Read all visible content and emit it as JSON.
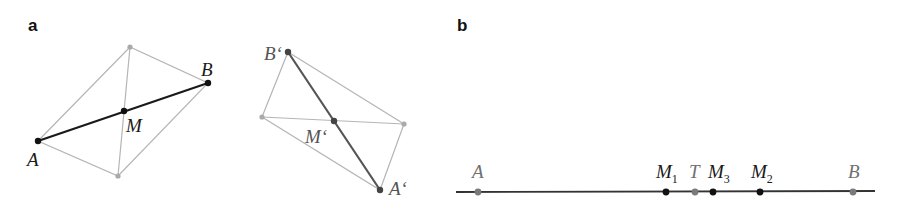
{
  "panels": {
    "a": {
      "label": "a",
      "original": {
        "points": {
          "A": {
            "label": "A",
            "x": 38,
            "y": 141
          },
          "B": {
            "label": "B",
            "x": 208,
            "y": 83
          },
          "M": {
            "label": "M",
            "x": 124,
            "y": 111
          },
          "P": {
            "x": 130,
            "y": 47
          },
          "Q": {
            "x": 118,
            "y": 176
          }
        }
      },
      "image": {
        "points": {
          "A": {
            "label": "A‘",
            "x": 380,
            "y": 190
          },
          "B": {
            "label": "B‘",
            "x": 288,
            "y": 52
          },
          "M": {
            "label": "M‘",
            "x": 334,
            "y": 121
          },
          "P": {
            "x": 262,
            "y": 117
          },
          "Q": {
            "x": 404,
            "y": 124
          }
        }
      }
    },
    "b": {
      "label": "b",
      "line": {
        "x1": 456,
        "x2": 875,
        "y": 192
      },
      "points": [
        {
          "id": "A",
          "label": "A",
          "sub": "",
          "x": 478,
          "color": "#7a7a7a"
        },
        {
          "id": "M1",
          "label": "M",
          "sub": "1",
          "x": 666,
          "color": "#111111"
        },
        {
          "id": "T",
          "label": "T",
          "sub": "",
          "x": 695,
          "color": "#7a7a7a"
        },
        {
          "id": "M3",
          "label": "M",
          "sub": "3",
          "x": 713,
          "color": "#111111"
        },
        {
          "id": "M2",
          "label": "M",
          "sub": "2",
          "x": 760,
          "color": "#111111"
        },
        {
          "id": "B",
          "label": "B",
          "sub": "",
          "x": 853,
          "color": "#7a7a7a"
        }
      ]
    }
  },
  "colors": {
    "construction": "#b5b5b5",
    "segment": "#1a1a1a",
    "image_segment": "#555555",
    "label_dark": "#1a1a1a",
    "label_gray": "#707070"
  }
}
